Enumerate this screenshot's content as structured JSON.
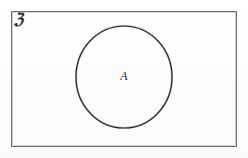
{
  "figure": {
    "kind": "venn-diagram",
    "width": 248,
    "height": 158,
    "background_color": "#fdfdfc"
  },
  "universe": {
    "label": "ℨ",
    "label_name": "universal-set-symbol",
    "description": "rectangle representing the universal set",
    "stroke_color": "#6d6d6d",
    "rect": {
      "x": 11,
      "y": 11,
      "width": 226,
      "height": 136
    },
    "label_position": {
      "x": 14,
      "y": 12
    }
  },
  "sets": [
    {
      "label": "A",
      "shape": "circle",
      "stroke_color": "#262626",
      "fill": "none",
      "stroke_width": 1.2,
      "bounds": {
        "x": 75,
        "y": 25,
        "width": 98,
        "height": 104
      },
      "center": {
        "cx": 124,
        "cy": 77
      },
      "radii": {
        "rx": 48,
        "ry": 51
      },
      "label_position": {
        "x": 124,
        "y": 77
      }
    }
  ]
}
